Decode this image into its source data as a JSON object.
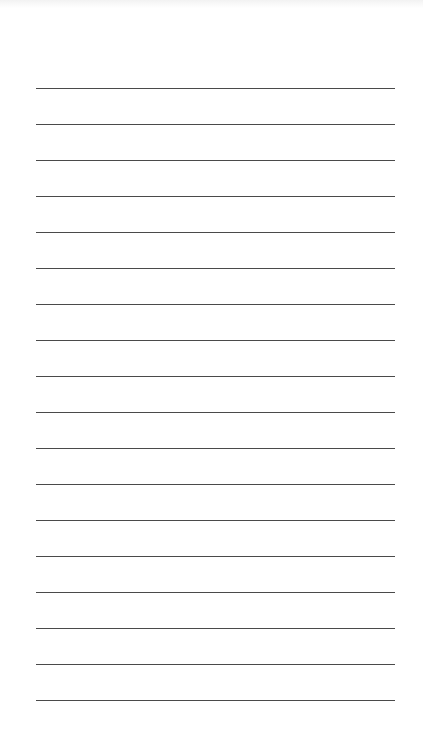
{
  "page": {
    "type": "lined-paper",
    "line_count": 18,
    "first_line_y": 88,
    "line_spacing": 36,
    "line_left": 36,
    "line_right": 395,
    "line_color": "#4a4a4a",
    "background": "#ffffff"
  },
  "lines": [
    {
      "text": ""
    },
    {
      "text": ""
    },
    {
      "text": ""
    },
    {
      "text": ""
    },
    {
      "text": ""
    },
    {
      "text": ""
    },
    {
      "text": ""
    },
    {
      "text": ""
    },
    {
      "text": ""
    },
    {
      "text": ""
    },
    {
      "text": ""
    },
    {
      "text": ""
    },
    {
      "text": ""
    },
    {
      "text": ""
    },
    {
      "text": ""
    },
    {
      "text": ""
    },
    {
      "text": ""
    },
    {
      "text": ""
    }
  ]
}
